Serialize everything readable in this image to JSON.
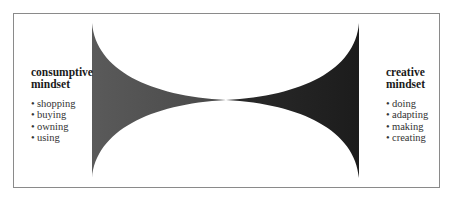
{
  "diagram": {
    "left": {
      "title_line1": "consumptive",
      "title_line2": "mindset",
      "items": [
        "shopping",
        "buying",
        "owning",
        "using"
      ],
      "fill_color": "#5a5a5a"
    },
    "right": {
      "title_line1": "creative",
      "title_line2": "mindset",
      "items": [
        "doing",
        "adapting",
        "making",
        "creating"
      ],
      "fill_color": "#1e1e1e"
    },
    "bullet_glyph": "•",
    "border_color": "#8a8a8a"
  }
}
